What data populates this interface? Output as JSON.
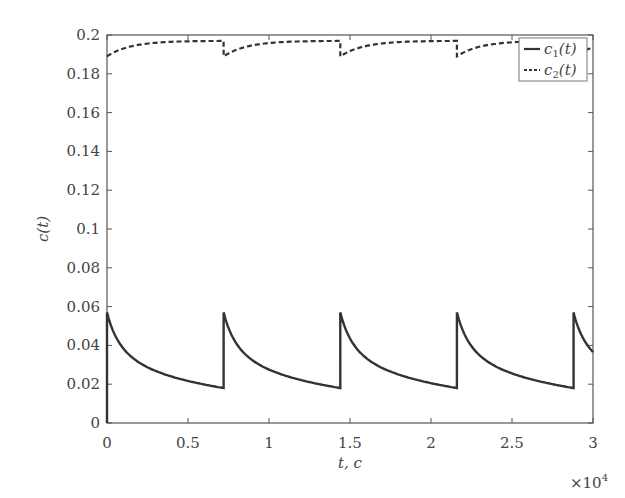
{
  "chart_data": {
    "type": "line",
    "title": "",
    "xlabel": "t, c",
    "ylabel": "c(t)",
    "x_multiplier": "×10^4",
    "xlim": [
      0,
      3
    ],
    "ylim": [
      0,
      0.2
    ],
    "xticks": [
      0,
      0.5,
      1,
      1.5,
      2,
      2.5,
      3
    ],
    "xtick_labels": [
      "0",
      "0.5",
      "1",
      "1.5",
      "2",
      "2.5",
      "3"
    ],
    "yticks": [
      0,
      0.02,
      0.04,
      0.06,
      0.08,
      0.1,
      0.12,
      0.14,
      0.16,
      0.18,
      0.2
    ],
    "ytick_labels": [
      "0",
      "0.02",
      "0.04",
      "0.06",
      "0.08",
      "0.1",
      "0.12",
      "0.14",
      "0.16",
      "0.18",
      "0.2"
    ],
    "grid": false,
    "legend_position": "upper right",
    "period": 0.72,
    "jump_times": [
      0,
      0.72,
      1.44,
      2.16,
      2.88
    ],
    "series": [
      {
        "name": "c1(t)",
        "label_base": "c",
        "label_sub": "1",
        "label_tail": "(t)",
        "style": "solid",
        "color": "#333333",
        "peak": 0.057,
        "trough": 0.018,
        "initial": 0.0,
        "final": 0.037
      },
      {
        "name": "c2(t)",
        "label_base": "c",
        "label_sub": "2",
        "label_tail": "(t)",
        "style": "dashed",
        "color": "#333333",
        "peak": 0.197,
        "trough": 0.189,
        "initial": 0.189,
        "final": 0.196
      }
    ]
  },
  "labels": {
    "xlabel": "t, c",
    "ylabel": "c(t)",
    "x_multiplier_base": "×10",
    "x_multiplier_exp": "4"
  }
}
